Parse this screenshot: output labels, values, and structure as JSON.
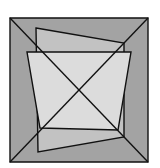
{
  "diagram": {
    "type": "geometric-figure",
    "colors": {
      "background": "#ffffff",
      "outer_square_fill": "#a3a3a3",
      "quad_a_fill": "#c2c2c2",
      "quad_b_fill": "#dcdcdc",
      "stroke": "#111111"
    },
    "outer_square": {
      "points": "10,18 148,18 148,162 10,162"
    },
    "diagonals": [
      {
        "x1": 10,
        "y1": 18,
        "x2": 148,
        "y2": 162
      },
      {
        "x1": 148,
        "y1": 18,
        "x2": 10,
        "y2": 162
      }
    ],
    "quad_a": {
      "points": "36,28 124,43 124,137 38,152"
    },
    "quad_b": {
      "points": "27,52 131,52 118,130 40,128"
    }
  }
}
